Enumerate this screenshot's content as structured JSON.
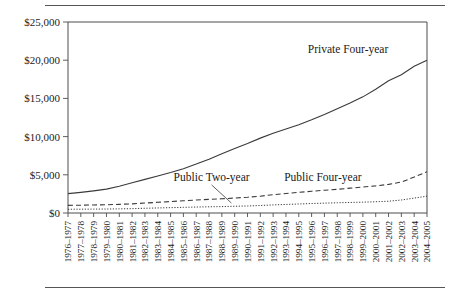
{
  "chart_data": {
    "type": "line",
    "title": "",
    "subtitle": "",
    "xlabel": "",
    "ylabel": "",
    "ylim": [
      0,
      25000
    ],
    "yticks": [
      0,
      5000,
      10000,
      15000,
      20000,
      25000
    ],
    "ytick_labels": [
      "$0",
      "$5,000",
      "$10,000",
      "$15,000",
      "$20,000",
      "$25,000"
    ],
    "grid": false,
    "legend_position": "inline-annotations",
    "categories": [
      "1976–1977",
      "1977–1978",
      "1978–1979",
      "1979–1980",
      "1980–1981",
      "1981–1982",
      "1982–1983",
      "1983–1984",
      "1984–1985",
      "1985–1986",
      "1986–1987",
      "1987–1988",
      "1988–1989",
      "1989–1990",
      "1990–1991",
      "1991–1992",
      "1992–1993",
      "1993–1994",
      "1994–1995",
      "1995–1996",
      "1996–1997",
      "1997–1998",
      "1998–1999",
      "1999–2000",
      "2000–2001",
      "2001–2002",
      "2002–2003",
      "2003–2004",
      "2004–2005"
    ],
    "series": [
      {
        "name": "Private Four-year",
        "style": "solid",
        "values": [
          2534,
          2700,
          2900,
          3130,
          3500,
          3950,
          4400,
          4850,
          5300,
          5800,
          6400,
          7050,
          7750,
          8450,
          9100,
          9800,
          10450,
          11000,
          11550,
          12200,
          12900,
          13650,
          14400,
          15200,
          16200,
          17300,
          18100,
          19200,
          20000
        ]
      },
      {
        "name": "Public Four-year",
        "style": "dashed",
        "values": [
          1000,
          1020,
          1050,
          1080,
          1130,
          1200,
          1300,
          1400,
          1500,
          1600,
          1700,
          1780,
          1860,
          1960,
          2060,
          2200,
          2400,
          2550,
          2700,
          2850,
          2980,
          3100,
          3250,
          3400,
          3550,
          3750,
          4050,
          4700,
          5400
        ]
      },
      {
        "name": "Public Two-year",
        "style": "dotted",
        "values": [
          490,
          500,
          510,
          520,
          540,
          570,
          620,
          660,
          700,
          740,
          780,
          810,
          840,
          880,
          920,
          980,
          1060,
          1120,
          1180,
          1240,
          1290,
          1340,
          1380,
          1420,
          1470,
          1540,
          1700,
          1950,
          2200
        ]
      }
    ],
    "annotations": [
      {
        "text": "Private Four-year",
        "x_frac": 0.78,
        "y_value": 21000
      },
      {
        "text": "Public Two-year",
        "x_frac": 0.4,
        "y_value": 4200
      },
      {
        "text": "Public Four-year",
        "x_frac": 0.71,
        "y_value": 4200
      }
    ]
  },
  "figure": {
    "top_rule": "horizontal-rule",
    "bottom_rule": "horizontal-rule"
  }
}
